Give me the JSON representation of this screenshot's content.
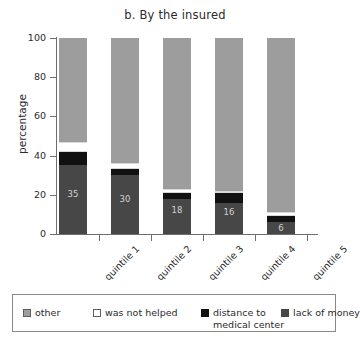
{
  "chart_data": {
    "type": "bar",
    "subtype": "stacked-column-100",
    "title": "b. By the insured",
    "xlabel": "",
    "ylabel": "percentage",
    "ylim": [
      0,
      100
    ],
    "yticks": [
      0,
      20,
      40,
      60,
      80,
      100
    ],
    "ytick_labels": [
      "0",
      "20",
      "40",
      "60",
      "80",
      "100"
    ],
    "grid": false,
    "legend_position": "bottom",
    "categories": [
      "quintile 1",
      "quintile 2",
      "quintile 3",
      "quintile 4",
      "quintile 5"
    ],
    "stack_order_bottom_to_top": [
      "lack of money",
      "distance to medical center",
      "was not helped",
      "other"
    ],
    "series": [
      {
        "name": "lack of money",
        "color": "#474747",
        "values": [
          35,
          30,
          18,
          16,
          6
        ],
        "data_labels": [
          "35",
          "30",
          "18",
          "16",
          "6"
        ]
      },
      {
        "name": "distance to medical center",
        "color": "#111111",
        "values": [
          7,
          3,
          3,
          5,
          3
        ],
        "data_labels": [
          "",
          "",
          "",
          "",
          ""
        ]
      },
      {
        "name": "was not helped",
        "color": "#ffffff",
        "values": [
          5,
          3,
          2,
          1,
          2
        ],
        "data_labels": [
          "",
          "",
          "",
          "",
          ""
        ]
      },
      {
        "name": "other",
        "color": "#9d9d9d",
        "values": [
          53,
          64,
          77,
          78,
          89
        ],
        "data_labels": [
          "",
          "",
          "",
          "",
          ""
        ]
      }
    ]
  },
  "legend": {
    "items": [
      {
        "label": "other",
        "swatch": "light-gray-square-swatch"
      },
      {
        "label": "was not helped",
        "swatch": "white-square-swatch"
      },
      {
        "label": "distance to",
        "label_line2": "medical center",
        "swatch": "black-square-swatch"
      },
      {
        "label": "lack of money",
        "swatch": "dark-gray-square-swatch"
      }
    ]
  },
  "colors": {
    "other": "#9d9d9d",
    "was_not_helped": "#ffffff",
    "distance_to_medical_center": "#111111",
    "lack_of_money": "#474747",
    "axis": "#6e6e6e",
    "text": "#2b2b2b"
  }
}
